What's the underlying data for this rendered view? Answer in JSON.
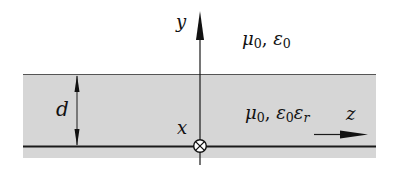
{
  "diagram": {
    "type": "dielectric slab on conductor cross-section",
    "colors": {
      "slab": "#d4d4d4",
      "line": "#1a1a1a",
      "background": "#ffffff"
    },
    "axes": {
      "y_label": "y",
      "z_label": "z",
      "x_label": "x",
      "x_symbol": "circle-cross (into page)"
    },
    "regions": {
      "upper": {
        "mu": "μ",
        "mu_sub": "0",
        "eps": "ε",
        "eps_sub": "0"
      },
      "slab": {
        "mu": "μ",
        "mu_sub": "0",
        "eps": "ε",
        "eps_sub": "0",
        "eps2": "ε",
        "eps2_sub": "r"
      }
    },
    "dimension": {
      "label": "d"
    },
    "separator": ", "
  }
}
